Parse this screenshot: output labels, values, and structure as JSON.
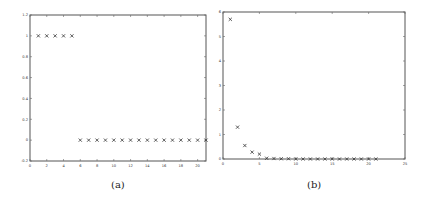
{
  "chart_data": [
    {
      "id": "a",
      "type": "scatter",
      "caption": "(a)",
      "marker": "x",
      "title": "",
      "xlabel": "",
      "ylabel": "",
      "xlim": [
        0,
        21
      ],
      "ylim": [
        -0.2,
        1.2
      ],
      "xticks": [
        0,
        2,
        4,
        6,
        8,
        10,
        12,
        14,
        16,
        18,
        20
      ],
      "yticks": [
        -0.2,
        0,
        0.2,
        0.4,
        0.6,
        0.8,
        1,
        1.2
      ],
      "xtick_labels": [
        "0",
        "2",
        "4",
        "6",
        "8",
        "10",
        "12",
        "14",
        "16",
        "18",
        "20"
      ],
      "ytick_labels": [
        "-0.2",
        "0",
        "0.2",
        "0.4",
        "0.6",
        "0.8",
        "1",
        "1.2"
      ],
      "grid": false,
      "series": [
        {
          "name": "points",
          "x": [
            1,
            2,
            3,
            4,
            5,
            6,
            7,
            8,
            9,
            10,
            11,
            12,
            13,
            14,
            15,
            16,
            17,
            18,
            19,
            20,
            21
          ],
          "y": [
            1,
            1,
            1,
            1,
            1,
            0,
            0,
            0,
            0,
            0,
            0,
            0,
            0,
            0,
            0,
            0,
            0,
            0,
            0,
            0,
            0
          ]
        }
      ]
    },
    {
      "id": "b",
      "type": "scatter",
      "caption": "(b)",
      "marker": "x",
      "title": "",
      "xlabel": "",
      "ylabel": "",
      "xlim": [
        0,
        25
      ],
      "ylim": [
        0,
        6
      ],
      "xticks": [
        0,
        5,
        10,
        15,
        20,
        25
      ],
      "yticks": [
        0,
        1,
        2,
        3,
        4,
        5,
        6
      ],
      "xtick_labels": [
        "0",
        "5",
        "10",
        "15",
        "20",
        "25"
      ],
      "ytick_labels": [
        "0",
        "1",
        "2",
        "3",
        "4",
        "5",
        "6"
      ],
      "grid": false,
      "series": [
        {
          "name": "points",
          "x": [
            1,
            2,
            3,
            4,
            5,
            6,
            7,
            8,
            9,
            10,
            11,
            12,
            13,
            14,
            15,
            16,
            17,
            18,
            19,
            20,
            21
          ],
          "y": [
            5.7,
            1.3,
            0.55,
            0.28,
            0.2,
            0.03,
            0.02,
            0.01,
            0.01,
            0,
            0,
            0,
            0,
            0,
            0,
            0,
            0,
            0,
            0,
            0,
            0
          ]
        }
      ]
    }
  ]
}
